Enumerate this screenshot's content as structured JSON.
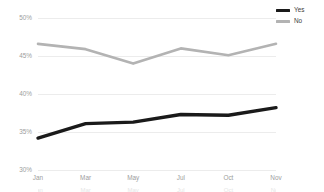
{
  "chart_data": {
    "type": "line",
    "title": "",
    "subtitle": "",
    "xlabel": "",
    "ylabel": "",
    "categories": [
      "Jan",
      "Mar",
      "May",
      "Jul",
      "Oct",
      "Nov"
    ],
    "series": [
      {
        "name": "Yes",
        "color": "#1a1a1a",
        "values": [
          34.2,
          36.1,
          36.3,
          37.3,
          37.2,
          38.2
        ]
      },
      {
        "name": "No",
        "color": "#b3b3b3",
        "values": [
          46.6,
          45.9,
          44.0,
          46.0,
          45.1,
          46.6
        ]
      }
    ],
    "ylim": [
      30,
      50
    ],
    "yticks": [
      50,
      45,
      40,
      35,
      30
    ],
    "ytick_labels": [
      "50%",
      "45%",
      "40%",
      "35%",
      "30%"
    ],
    "grid": true,
    "legend_position": "top-right",
    "axis_label_color": "#9d9d9d",
    "gridline_color": "#ececec",
    "background": "#ffffff"
  },
  "legend": {
    "items": [
      {
        "label": "Yes",
        "color": "#1a1a1a"
      },
      {
        "label": "No",
        "color": "#b3b3b3"
      }
    ]
  },
  "footer_ghost": {
    "items": [
      "Jan",
      "Mar",
      "May",
      "Jul",
      "Oct",
      "Nov"
    ]
  }
}
